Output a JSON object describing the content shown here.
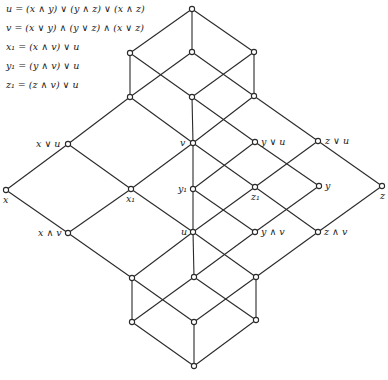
{
  "formulas": [
    "u = (x ∧ y) ∨ (y ∧ z) ∨ (x ∧ z)",
    "v = (x ∨ y) ∧ (y ∨ z) ∧ (x ∨ z)",
    "x₁ = (x ∧ v) ∨ u",
    "y₁ = (y ∧ v) ∨ u",
    "z₁ = (z ∧ v) ∨ u"
  ],
  "diagram": {
    "type": "lattice_hasse_diagram",
    "nodes": [
      {
        "id": "top",
        "x": 192,
        "y": 9,
        "label": ""
      },
      {
        "id": "a",
        "x": 130,
        "y": 53,
        "label": ""
      },
      {
        "id": "b",
        "x": 192,
        "y": 52,
        "label": ""
      },
      {
        "id": "c",
        "x": 254,
        "y": 52,
        "label": ""
      },
      {
        "id": "d",
        "x": 130,
        "y": 97,
        "label": ""
      },
      {
        "id": "e",
        "x": 192,
        "y": 97,
        "label": ""
      },
      {
        "id": "f",
        "x": 254,
        "y": 96,
        "label": ""
      },
      {
        "id": "xu",
        "x": 68,
        "y": 144,
        "label": "x ∨ u",
        "lx": 36,
        "ly": 147
      },
      {
        "id": "v",
        "x": 193,
        "y": 143,
        "label": "v",
        "lx": 180,
        "ly": 146
      },
      {
        "id": "yu",
        "x": 255,
        "y": 142,
        "label": "y ∨ u",
        "lx": 261,
        "ly": 145
      },
      {
        "id": "zu",
        "x": 318,
        "y": 141,
        "label": "z ∨ u",
        "lx": 325,
        "ly": 144
      },
      {
        "id": "x",
        "x": 6,
        "y": 190,
        "label": "x",
        "lx": 3,
        "ly": 203
      },
      {
        "id": "x1",
        "x": 131,
        "y": 189,
        "label": "x₁",
        "lx": 126,
        "ly": 202
      },
      {
        "id": "y1",
        "x": 193,
        "y": 189,
        "label": "y₁",
        "lx": 178,
        "ly": 192
      },
      {
        "id": "z1",
        "x": 255,
        "y": 187,
        "label": "z₁",
        "lx": 251,
        "ly": 200
      },
      {
        "id": "y",
        "x": 319,
        "y": 186,
        "label": "y",
        "lx": 325,
        "ly": 189
      },
      {
        "id": "z",
        "x": 382,
        "y": 186,
        "label": "z",
        "lx": 380,
        "ly": 199
      },
      {
        "id": "xv",
        "x": 68,
        "y": 233,
        "label": "x ∧ v",
        "lx": 38,
        "ly": 236
      },
      {
        "id": "u",
        "x": 193,
        "y": 232,
        "label": "u",
        "lx": 181,
        "ly": 235
      },
      {
        "id": "yv",
        "x": 255,
        "y": 232,
        "label": "y ∧ v",
        "lx": 261,
        "ly": 235
      },
      {
        "id": "zv",
        "x": 318,
        "y": 232,
        "label": "z ∧ v",
        "lx": 324,
        "ly": 235
      },
      {
        "id": "g",
        "x": 132,
        "y": 278,
        "label": ""
      },
      {
        "id": "h",
        "x": 194,
        "y": 277,
        "label": ""
      },
      {
        "id": "i",
        "x": 256,
        "y": 277,
        "label": ""
      },
      {
        "id": "j",
        "x": 132,
        "y": 322,
        "label": ""
      },
      {
        "id": "k",
        "x": 194,
        "y": 322,
        "label": ""
      },
      {
        "id": "l",
        "x": 256,
        "y": 320,
        "label": ""
      },
      {
        "id": "bottom",
        "x": 194,
        "y": 366,
        "label": ""
      }
    ],
    "edges": [
      [
        "top",
        "a"
      ],
      [
        "top",
        "b"
      ],
      [
        "top",
        "c"
      ],
      [
        "a",
        "d"
      ],
      [
        "a",
        "e"
      ],
      [
        "b",
        "d"
      ],
      [
        "b",
        "f"
      ],
      [
        "c",
        "e"
      ],
      [
        "c",
        "f"
      ],
      [
        "d",
        "xu"
      ],
      [
        "d",
        "v"
      ],
      [
        "e",
        "v"
      ],
      [
        "e",
        "yu"
      ],
      [
        "f",
        "v"
      ],
      [
        "f",
        "zu"
      ],
      [
        "xu",
        "x"
      ],
      [
        "xu",
        "x1"
      ],
      [
        "v",
        "x1"
      ],
      [
        "v",
        "y1"
      ],
      [
        "v",
        "z1"
      ],
      [
        "yu",
        "y1"
      ],
      [
        "yu",
        "y"
      ],
      [
        "zu",
        "z1"
      ],
      [
        "zu",
        "z"
      ],
      [
        "x",
        "xv"
      ],
      [
        "x1",
        "xv"
      ],
      [
        "x1",
        "u"
      ],
      [
        "y1",
        "u"
      ],
      [
        "y1",
        "yv"
      ],
      [
        "z1",
        "u"
      ],
      [
        "z1",
        "zv"
      ],
      [
        "y",
        "yv"
      ],
      [
        "z",
        "zv"
      ],
      [
        "xv",
        "g"
      ],
      [
        "u",
        "g"
      ],
      [
        "u",
        "h"
      ],
      [
        "u",
        "i"
      ],
      [
        "yv",
        "h"
      ],
      [
        "zv",
        "i"
      ],
      [
        "g",
        "j"
      ],
      [
        "g",
        "k"
      ],
      [
        "h",
        "j"
      ],
      [
        "h",
        "l"
      ],
      [
        "i",
        "k"
      ],
      [
        "i",
        "l"
      ],
      [
        "j",
        "bottom"
      ],
      [
        "k",
        "bottom"
      ],
      [
        "l",
        "bottom"
      ]
    ]
  }
}
